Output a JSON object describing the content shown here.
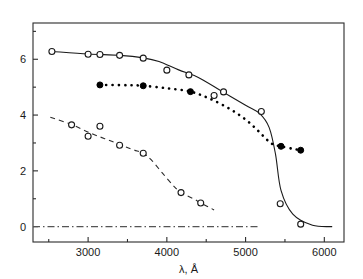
{
  "figure": {
    "background_color": "#ffffff",
    "foreground_color": "#1a1a1a"
  },
  "axes": {
    "x_title": "λ, Å",
    "y_title": "",
    "x_major_labels": [
      "3000",
      "4000",
      "5000",
      "6000"
    ],
    "y_major_labels": [
      "0",
      "2",
      "4",
      "6"
    ]
  },
  "chart_data": {
    "type": "line",
    "title": "",
    "xlabel": "λ, Å",
    "ylabel": "",
    "xlim": [
      2300,
      6250
    ],
    "ylim": [
      -0.55,
      7.3
    ],
    "xticks": [
      3000,
      4000,
      5000,
      6000
    ],
    "xticks_minor": [
      2500,
      3500,
      4500,
      5500
    ],
    "yticks": [
      0,
      2,
      4,
      6
    ],
    "yticks_minor": [
      1,
      3,
      5,
      7
    ],
    "grid": false,
    "legend": "none",
    "reference_lines": [
      {
        "name": "zero-baseline",
        "orientation": "horizontal",
        "y": 0,
        "x_start": 2300,
        "x_end": 5180,
        "style": "dash-dot",
        "color": "#555555"
      }
    ],
    "series": [
      {
        "name": "upper-solid-curve",
        "line_style": "solid",
        "marker": "open-circle",
        "color": "#1a1a1a",
        "x": [
          2540,
          3000,
          3150,
          3400,
          3700,
          4000,
          4280,
          4600,
          4720,
          5200,
          5440,
          5700
        ],
        "y": [
          6.28,
          6.18,
          6.17,
          6.14,
          6.04,
          5.61,
          5.44,
          4.7,
          4.83,
          4.13,
          0.82,
          0.09
        ],
        "curve_path_x": [
          2540,
          3000,
          3400,
          3700,
          3900,
          4150,
          4400,
          4700,
          5000,
          5180,
          5300,
          5380,
          5450,
          5600,
          5850,
          6100
        ],
        "curve_path_y": [
          6.28,
          6.19,
          6.14,
          6.05,
          5.92,
          5.62,
          5.35,
          4.85,
          4.35,
          4.05,
          3.55,
          2.6,
          1.3,
          0.45,
          0.05,
          0.0
        ]
      },
      {
        "name": "middle-dotted-curve",
        "line_style": "dotted",
        "marker": "filled-circle",
        "color": "#000000",
        "x": [
          3150,
          3700,
          4300,
          5450,
          5700
        ],
        "y": [
          5.08,
          5.05,
          4.84,
          2.88,
          2.74
        ],
        "curve_path_x": [
          3150,
          3500,
          3700,
          4000,
          4300,
          4550,
          4800,
          5000,
          5150,
          5270,
          5350,
          5450,
          5600,
          5700
        ],
        "curve_path_y": [
          5.08,
          5.07,
          5.05,
          4.96,
          4.84,
          4.58,
          4.22,
          3.84,
          3.46,
          3.12,
          2.95,
          2.88,
          2.79,
          2.74
        ]
      },
      {
        "name": "lower-dashed-curve",
        "line_style": "dashed",
        "marker": "open-circle",
        "color": "#2b2b2b",
        "x": [
          2790,
          3000,
          3150,
          3400,
          3700,
          4180,
          4430
        ],
        "y": [
          3.65,
          3.24,
          3.6,
          2.92,
          2.63,
          1.22,
          0.85
        ],
        "curve_path_x": [
          2520,
          2790,
          3050,
          3300,
          3550,
          3700,
          3800,
          3950,
          4100,
          4180,
          4350,
          4430,
          4600
        ],
        "curve_path_y": [
          3.92,
          3.66,
          3.33,
          3.06,
          2.78,
          2.63,
          2.4,
          1.9,
          1.42,
          1.22,
          0.98,
          0.85,
          0.6
        ]
      }
    ]
  }
}
